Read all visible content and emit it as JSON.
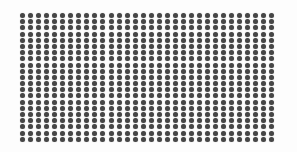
{
  "image": {
    "width": 297,
    "height": 152,
    "background": "#fdfdfd",
    "description": "Regular grid of dark gray circular dots"
  },
  "dot_grid": {
    "columns": 32,
    "rows": 21,
    "origin_x": 20,
    "origin_y": 13,
    "pitch_x": 8.05,
    "pitch_y": 6.2,
    "dot_diameter": 5,
    "dot_color": "#464646"
  }
}
